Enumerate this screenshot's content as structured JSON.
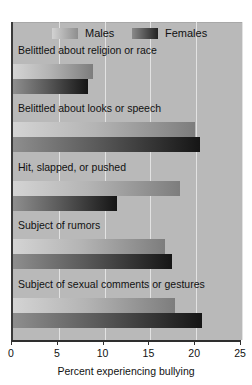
{
  "chart_data": {
    "type": "bar",
    "orientation": "horizontal",
    "title": "",
    "xlabel": "Percent experiencing bullying",
    "ylabel": "",
    "xlim": [
      0,
      25
    ],
    "xticks": [
      0,
      5,
      10,
      15,
      20,
      25
    ],
    "xtick_labels": [
      "0",
      "5",
      "10",
      "15",
      "20",
      "25"
    ],
    "grid": true,
    "grid_axis": "x",
    "legend_position": "top",
    "categories": [
      "Belittled about religion or race",
      "Belittled about looks or speech",
      "Hit, slapped, or pushed",
      "Subject of rumors",
      "Subject of sexual comments or gestures"
    ],
    "series": [
      {
        "name": "Males",
        "color": "#b4b4b4",
        "values": [
          8.7,
          19.9,
          18.2,
          16.6,
          17.7
        ]
      },
      {
        "name": "Females",
        "color": "#3a3a3a",
        "values": [
          8.2,
          20.4,
          11.4,
          17.4,
          20.6
        ]
      }
    ]
  },
  "legend": {
    "items": [
      {
        "label": "Males"
      },
      {
        "label": "Females"
      }
    ]
  },
  "colors": {
    "panel_background": "#b9b9b9",
    "gridline": "#e2e2e2",
    "axis": "#2e2e2e",
    "text": "#111111"
  }
}
